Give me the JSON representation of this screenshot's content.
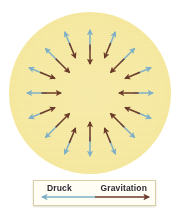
{
  "figure": {
    "name": "stellar-equilibrium-diagram",
    "star": {
      "label": "star-disc",
      "fill_color": "#f6eaa5",
      "edge_color": "#f5e79b"
    },
    "forces": {
      "outward": {
        "name": "Druck",
        "color": "#7fb0c6",
        "direction": "outward"
      },
      "inward": {
        "name": "Gravitation",
        "color": "#6b3b2a",
        "direction": "inward"
      }
    },
    "arrow_pair_count": 16
  },
  "legend": {
    "pressure_label": "Druck",
    "gravitation_label": "Gravitation",
    "pressure_color": "#7fb0c6",
    "gravitation_color": "#6b3b2a"
  },
  "chart_data": {
    "type": "diagram",
    "title": "",
    "legend": [
      "Druck",
      "Gravitation"
    ],
    "arrow_pairs": [
      {
        "angle_deg": 0,
        "outward": "Druck",
        "inward": "Gravitation"
      },
      {
        "angle_deg": 22.5,
        "outward": "Druck",
        "inward": "Gravitation"
      },
      {
        "angle_deg": 45,
        "outward": "Druck",
        "inward": "Gravitation"
      },
      {
        "angle_deg": 67.5,
        "outward": "Druck",
        "inward": "Gravitation"
      },
      {
        "angle_deg": 90,
        "outward": "Druck",
        "inward": "Gravitation"
      },
      {
        "angle_deg": 112.5,
        "outward": "Druck",
        "inward": "Gravitation"
      },
      {
        "angle_deg": 135,
        "outward": "Druck",
        "inward": "Gravitation"
      },
      {
        "angle_deg": 157.5,
        "outward": "Druck",
        "inward": "Gravitation"
      },
      {
        "angle_deg": 180,
        "outward": "Druck",
        "inward": "Gravitation"
      },
      {
        "angle_deg": 202.5,
        "outward": "Druck",
        "inward": "Gravitation"
      },
      {
        "angle_deg": 225,
        "outward": "Druck",
        "inward": "Gravitation"
      },
      {
        "angle_deg": 247.5,
        "outward": "Druck",
        "inward": "Gravitation"
      },
      {
        "angle_deg": 270,
        "outward": "Druck",
        "inward": "Gravitation"
      },
      {
        "angle_deg": 292.5,
        "outward": "Druck",
        "inward": "Gravitation"
      },
      {
        "angle_deg": 315,
        "outward": "Druck",
        "inward": "Gravitation"
      },
      {
        "angle_deg": 337.5,
        "outward": "Druck",
        "inward": "Gravitation"
      }
    ]
  }
}
